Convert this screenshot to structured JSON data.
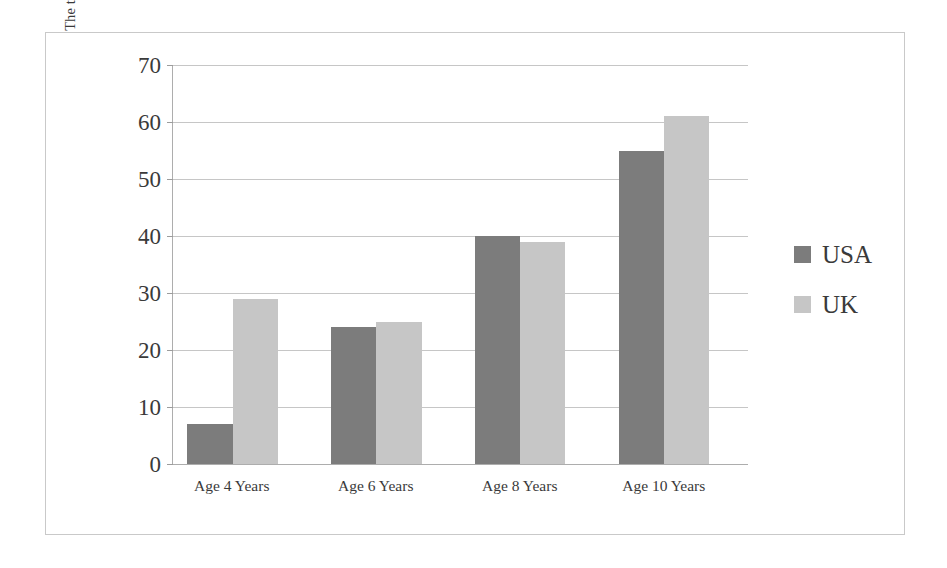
{
  "chart_data": {
    "type": "bar",
    "title": "",
    "subtitle": "",
    "xlabel": "",
    "ylabel": "The total number of different plants named by 9 different children, by age and country",
    "categories": [
      "Age 4 Years",
      "Age 6 Years",
      "Age 8 Years",
      "Age 10 Years"
    ],
    "series": [
      {
        "name": "USA",
        "values": [
          7,
          24,
          40,
          55
        ],
        "color": "#7c7c7c"
      },
      {
        "name": "UK",
        "values": [
          29,
          25,
          39,
          61
        ],
        "color": "#c6c6c6"
      }
    ],
    "ylim": [
      0,
      70
    ],
    "ytick_step": 10,
    "yticks": [
      0,
      10,
      20,
      30,
      40,
      50,
      60,
      70
    ],
    "ytick_labels": [
      "0",
      "10",
      "20",
      "30",
      "40",
      "50",
      "60",
      "70"
    ],
    "grid": true,
    "grid_axis": "y",
    "grid_color": "#c6c6c6",
    "legend_position": "right",
    "axis_color": "#adadad",
    "background": "#ffffff",
    "border_color": "#c9c9c9"
  },
  "legend": {
    "items": [
      {
        "label": "USA",
        "swatch": "legend-swatch-usa"
      },
      {
        "label": "UK",
        "swatch": "legend-swatch-uk"
      }
    ]
  }
}
